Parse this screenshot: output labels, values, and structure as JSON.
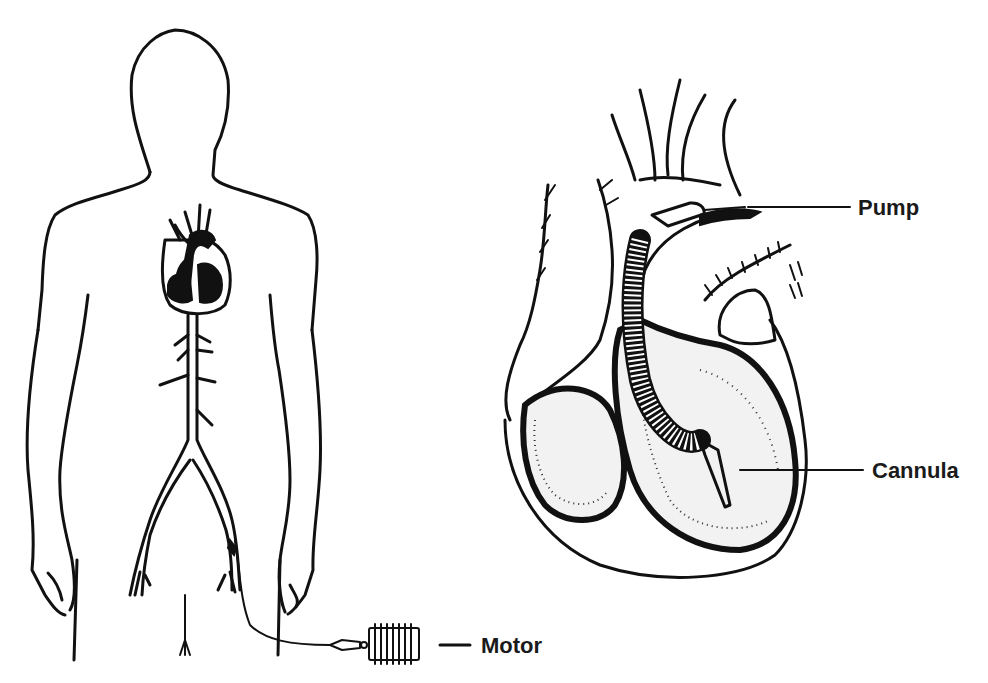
{
  "figure": {
    "colors": {
      "ink": "#111111",
      "background": "#ffffff",
      "label": "#1a1a1a"
    }
  },
  "panels": {
    "body": {
      "name": "human-body-outline",
      "features": [
        "heart",
        "aorta",
        "femoral-artery",
        "drive-cable"
      ]
    },
    "heart": {
      "name": "heart-cross-section",
      "features": [
        "aortic-arch",
        "pump",
        "cannula",
        "left-ventricle",
        "right-ventricle"
      ]
    }
  },
  "labels": {
    "pump": "Pump",
    "cannula": "Cannula",
    "motor": "Motor"
  }
}
